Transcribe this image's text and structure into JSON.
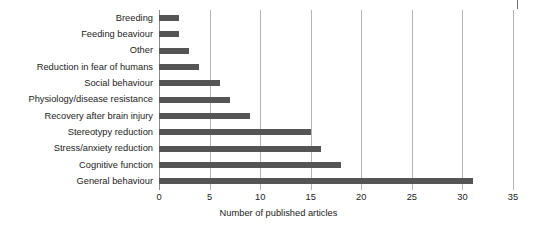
{
  "chart_data": {
    "type": "bar",
    "orientation": "horizontal",
    "title": "",
    "xlabel": "Number of published articles",
    "ylabel": "",
    "xlim": [
      0,
      35
    ],
    "xticks": [
      "0",
      "5",
      "10",
      "15",
      "20",
      "25",
      "30",
      "35"
    ],
    "grid": "vertical",
    "legend": null,
    "categories": [
      "Breeding",
      "Feeding beaviour",
      "Other",
      "Reduction in fear of humans",
      "Social behaviour",
      "Physiology/disease resistance",
      "Recovery after brain injury",
      "Stereotypy reduction",
      "Stress/anxiety reduction",
      "Cognitive function",
      "General behaviour"
    ],
    "values": [
      2,
      2,
      3,
      4,
      6,
      7,
      9,
      15,
      16,
      18,
      31
    ],
    "colors": {
      "bar": "#555555",
      "gridline": "#b4b4b4",
      "axis": "#8d8d8d",
      "text": "#1c1c1c",
      "background": "#ffffff"
    }
  }
}
